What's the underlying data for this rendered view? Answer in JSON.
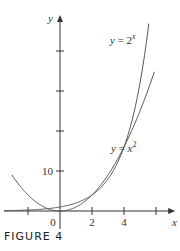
{
  "figure_caption": "FIGURE 4",
  "chart_data": {
    "type": "line",
    "title": "",
    "xlabel": "x",
    "ylabel": "y",
    "xlim": [
      -3.5,
      7.2
    ],
    "ylim": [
      -2,
      49
    ],
    "x_ticks": [
      -2,
      0,
      2,
      4,
      6
    ],
    "x_tick_labels": [
      {
        "value": 0,
        "label": "0"
      },
      {
        "value": 2,
        "label": "2"
      },
      {
        "value": 4,
        "label": "4"
      }
    ],
    "y_ticks": [
      10,
      20,
      30,
      40
    ],
    "y_tick_labels": [
      {
        "value": 10,
        "label": "10"
      }
    ],
    "series": [
      {
        "name": "y = 2^x",
        "label_base": "y = 2",
        "label_sup": "x",
        "function": "2^x",
        "domain": [
          -3.5,
          5.55
        ]
      },
      {
        "name": "y = x^2",
        "label_base": "y = x",
        "label_sup": "2",
        "function": "x^2",
        "domain": [
          -3.0,
          5.9
        ]
      }
    ],
    "intersections": [
      [
        2,
        4
      ],
      [
        4,
        16
      ]
    ],
    "grid": false,
    "legend": "none"
  }
}
